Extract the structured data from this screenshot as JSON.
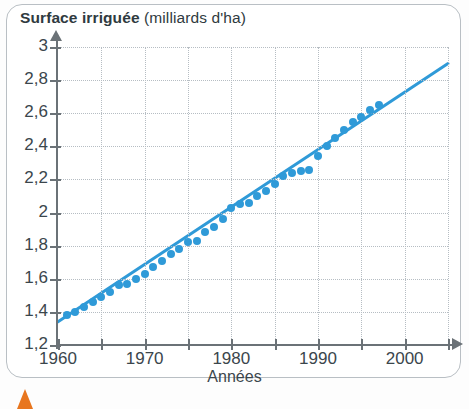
{
  "figure": {
    "title_strong": "Surface irriguée",
    "title_unit": "(milliards d'ha)",
    "marker_icon": "orange-triangle-icon"
  },
  "chart_data": {
    "type": "scatter",
    "title": "Surface irriguée (milliards d'ha)",
    "xlabel": "Années",
    "ylabel": "milliards d'ha",
    "xlim": [
      1960,
      2005
    ],
    "ylim": [
      1.2,
      3.0
    ],
    "xticks": [
      1960,
      1965,
      1970,
      1975,
      1980,
      1985,
      1990,
      1995,
      2000,
      2005
    ],
    "xtick_labels": [
      "1960",
      "",
      "1970",
      "",
      "1980",
      "",
      "1990",
      "",
      "2000",
      ""
    ],
    "yticks": [
      1.2,
      1.4,
      1.6,
      1.8,
      2.0,
      2.2,
      2.4,
      2.6,
      2.8,
      3.0
    ],
    "ytick_labels": [
      "1,2",
      "1,4",
      "1,6",
      "1,8",
      "2",
      "2,2",
      "2,4",
      "2,6",
      "2,8",
      "3"
    ],
    "grid": true,
    "legend": "none",
    "series": [
      {
        "name": "Surface irriguée observée",
        "type": "scatter",
        "color": "#2f9ad8",
        "x": [
          1961,
          1962,
          1963,
          1964,
          1965,
          1966,
          1967,
          1968,
          1969,
          1970,
          1971,
          1972,
          1973,
          1974,
          1975,
          1976,
          1977,
          1978,
          1979,
          1980,
          1981,
          1982,
          1983,
          1984,
          1985,
          1986,
          1987,
          1988,
          1989,
          1990,
          1991,
          1992,
          1993,
          1994,
          1995,
          1996,
          1997
        ],
        "y": [
          1.38,
          1.4,
          1.43,
          1.46,
          1.49,
          1.52,
          1.56,
          1.57,
          1.6,
          1.63,
          1.67,
          1.71,
          1.75,
          1.78,
          1.82,
          1.83,
          1.88,
          1.91,
          1.96,
          2.03,
          2.05,
          2.06,
          2.1,
          2.13,
          2.17,
          2.22,
          2.24,
          2.25,
          2.26,
          2.34,
          2.4,
          2.45,
          2.5,
          2.55,
          2.58,
          2.62,
          2.65
        ]
      },
      {
        "name": "Droite de tendance",
        "type": "line",
        "color": "#2f9ad8",
        "x": [
          1960,
          2005
        ],
        "y": [
          1.34,
          2.9
        ]
      }
    ]
  }
}
